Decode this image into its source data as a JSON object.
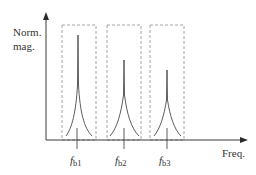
{
  "diagram": {
    "y_axis_label_line1": "Norm.",
    "y_axis_label_line2": "mag.",
    "x_axis_label": "Freq.",
    "peaks": [
      {
        "label_main": "f",
        "label_sub": "b1",
        "center_x": 78,
        "peak_y": 35,
        "left_foot_x": 66,
        "right_foot_x": 92,
        "box": {
          "x1": 62,
          "x2": 96
        }
      },
      {
        "label_main": "f",
        "label_sub": "b2",
        "center_x": 124,
        "peak_y": 60,
        "left_foot_x": 110,
        "right_foot_x": 139,
        "box": {
          "x1": 107,
          "x2": 141
        }
      },
      {
        "label_main": "f",
        "label_sub": "b3",
        "center_x": 167,
        "peak_y": 70,
        "left_foot_x": 154,
        "right_foot_x": 181,
        "box": {
          "x1": 150,
          "x2": 184
        }
      }
    ],
    "colors": {
      "axis": "#3a3a3a",
      "box_dashed": "#9a9a9a",
      "curve": "#4a4a4a",
      "text": "#333333"
    }
  }
}
